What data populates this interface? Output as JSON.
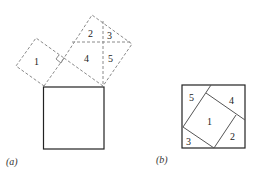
{
  "figure": {
    "panel_a": {
      "caption": "(a)",
      "pieces": [
        {
          "label": "1"
        },
        {
          "label": "2"
        },
        {
          "label": "3"
        },
        {
          "label": "4"
        },
        {
          "label": "5"
        }
      ]
    },
    "panel_b": {
      "caption": "(b)",
      "pieces": [
        {
          "label": "1"
        },
        {
          "label": "2"
        },
        {
          "label": "3"
        },
        {
          "label": "4"
        },
        {
          "label": "5"
        }
      ]
    },
    "colors": {
      "dashed_lines": "#8a8a8a",
      "solid_lines": "#222222",
      "background": "#ffffff"
    }
  }
}
